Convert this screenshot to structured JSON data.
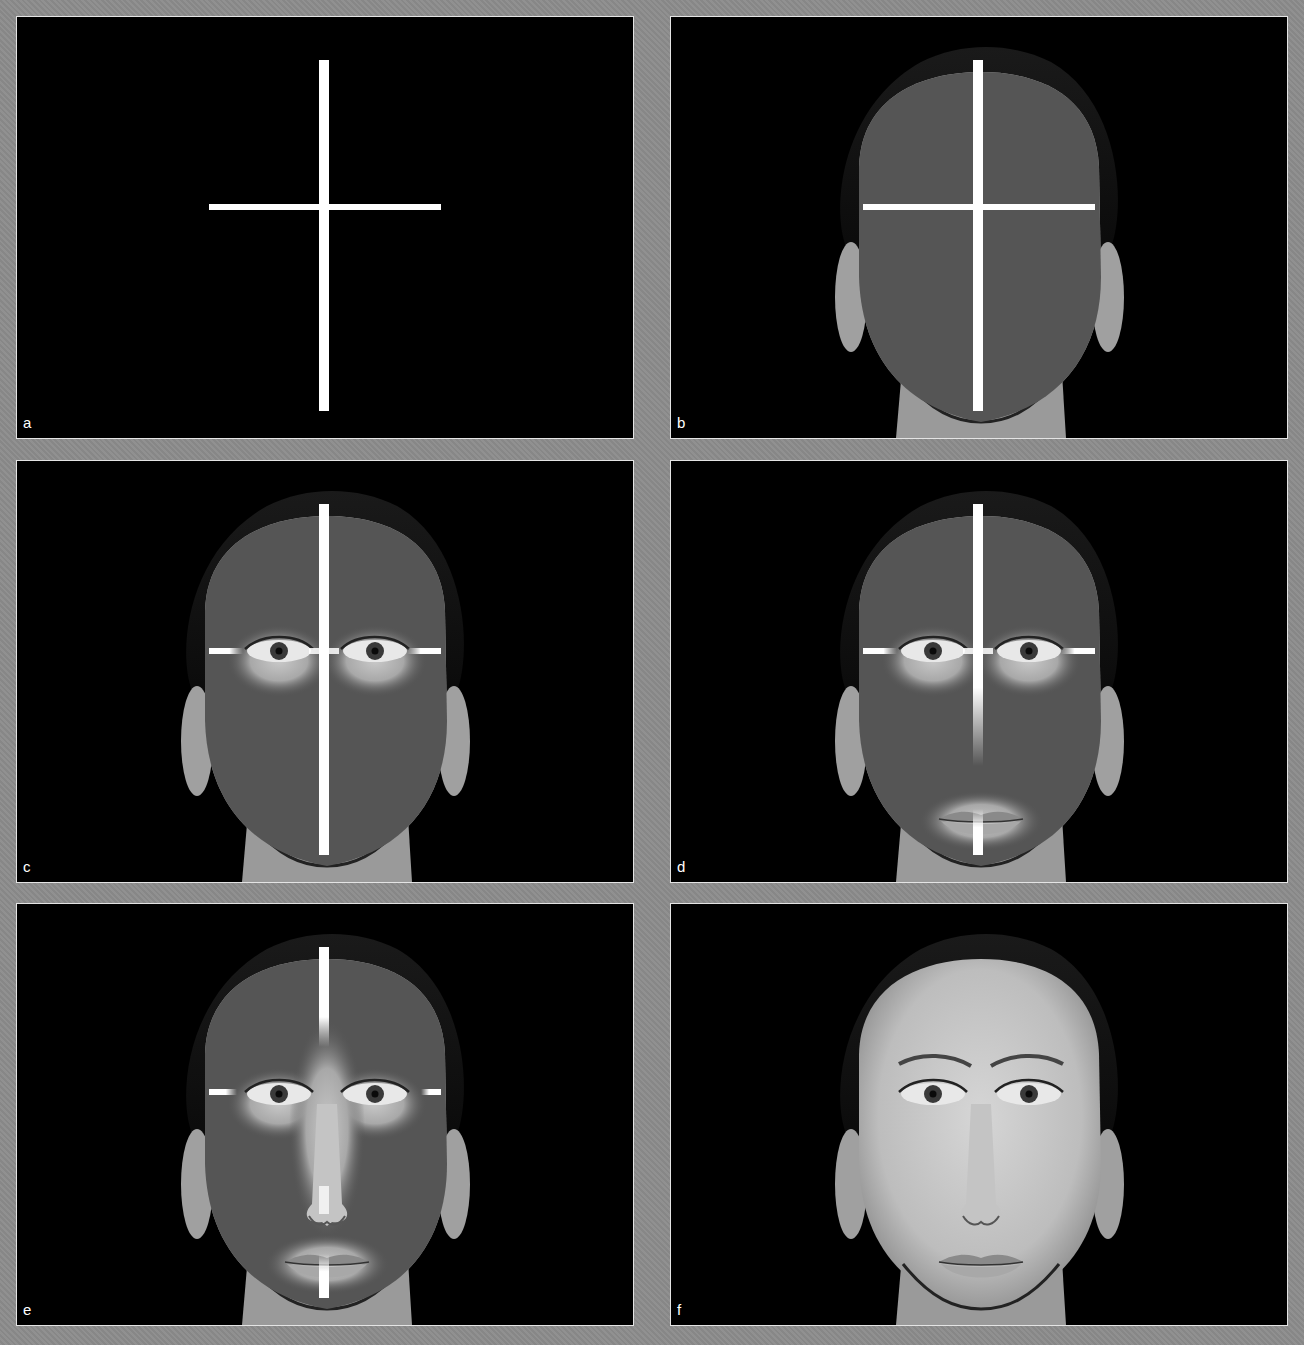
{
  "figure": {
    "background_color": "#8c8c8c",
    "panel_border_color": "#e4e4e4",
    "bar_color": "#ffffff",
    "mask_color": "#555555",
    "panels": [
      {
        "label": "a",
        "x": 16,
        "y": 16,
        "content": "crosshair-only"
      },
      {
        "label": "b",
        "x": 670,
        "y": 16,
        "content": "face-masked-with-crosshair"
      },
      {
        "label": "c",
        "x": 16,
        "y": 460,
        "content": "eyes-revealed"
      },
      {
        "label": "d",
        "x": 670,
        "y": 460,
        "content": "eyes-and-lips-revealed"
      },
      {
        "label": "e",
        "x": 16,
        "y": 903,
        "content": "eyes-nose-lips-revealed"
      },
      {
        "label": "f",
        "x": 670,
        "y": 903,
        "content": "full-face"
      }
    ]
  }
}
